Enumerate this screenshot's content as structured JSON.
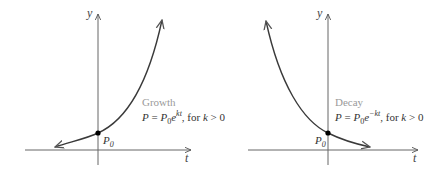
{
  "panels": [
    {
      "name": "growth",
      "title": "Growth",
      "formula": {
        "lhs": "P",
        "eq": " = ",
        "base": "P",
        "base_sub": "0",
        "e": "e",
        "exponent": "kt",
        "tail": ", for ",
        "cond_var": "k",
        "cond": " > 0"
      },
      "point_label": "P",
      "point_sub": "0",
      "x_axis_label": "t",
      "y_axis_label": "y"
    },
    {
      "name": "decay",
      "title": "Decay",
      "formula": {
        "lhs": "P",
        "eq": " = ",
        "base": "P",
        "base_sub": "0",
        "e": "e",
        "exponent": "−kt",
        "tail": ", for ",
        "cond_var": "k",
        "cond": " > 0"
      },
      "point_label": "P",
      "point_sub": "0",
      "x_axis_label": "t",
      "y_axis_label": "y"
    }
  ],
  "colors": {
    "curve": "#3a3a3a",
    "axis": "#555555",
    "title": "#9a9a9a",
    "point": "#000000"
  }
}
